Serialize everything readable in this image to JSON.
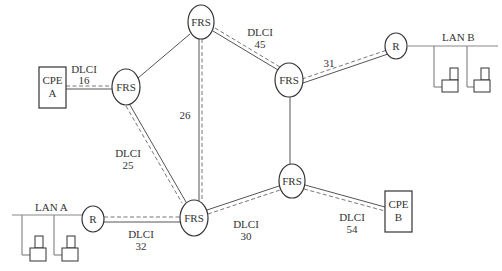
{
  "diagram": {
    "type": "frame-relay-network",
    "nodes": {
      "frs_top": {
        "label": "FRS"
      },
      "frs_left": {
        "label": "FRS"
      },
      "frs_mid_right": {
        "label": "FRS"
      },
      "frs_lower_right": {
        "label": "FRS"
      },
      "frs_bottom": {
        "label": "FRS"
      },
      "router_b": {
        "label": "R"
      },
      "router_a": {
        "label": "R"
      },
      "cpe_a": {
        "line1": "CPE",
        "line2": "A"
      },
      "cpe_b": {
        "line1": "CPE",
        "line2": "B"
      }
    },
    "lans": {
      "lan_a": {
        "label": "LAN A"
      },
      "lan_b": {
        "label": "LAN B"
      }
    },
    "dlci_labels": {
      "d16": {
        "line1": "DLCI",
        "line2": "16"
      },
      "d45": {
        "line1": "DLCI",
        "line2": "45"
      },
      "d31": {
        "line1": "31"
      },
      "d26": {
        "line1": "26"
      },
      "d25": {
        "line1": "DLCI",
        "line2": "25"
      },
      "d32": {
        "line1": "DLCI",
        "line2": "32"
      },
      "d30": {
        "line1": "DLCI",
        "line2": "30"
      },
      "d54": {
        "line1": "DLCI",
        "line2": "54"
      }
    },
    "links": [
      {
        "from": "cpe_a",
        "to": "frs_left",
        "virtual_circuit": true,
        "dlci": "16"
      },
      {
        "from": "frs_left",
        "to": "frs_top",
        "virtual_circuit": false
      },
      {
        "from": "frs_left",
        "to": "frs_bottom",
        "virtual_circuit": true,
        "dlci": "25"
      },
      {
        "from": "frs_top",
        "to": "frs_bottom",
        "virtual_circuit": true,
        "dlci": "26"
      },
      {
        "from": "frs_top",
        "to": "frs_mid_right",
        "virtual_circuit": true,
        "dlci": "45"
      },
      {
        "from": "frs_mid_right",
        "to": "router_b",
        "virtual_circuit": true,
        "dlci": "31"
      },
      {
        "from": "frs_mid_right",
        "to": "frs_lower_right",
        "virtual_circuit": false
      },
      {
        "from": "router_a",
        "to": "frs_bottom",
        "virtual_circuit": true,
        "dlci": "32"
      },
      {
        "from": "frs_bottom",
        "to": "frs_lower_right",
        "virtual_circuit": true,
        "dlci": "30"
      },
      {
        "from": "frs_lower_right",
        "to": "cpe_b",
        "virtual_circuit": true,
        "dlci": "54"
      }
    ]
  }
}
